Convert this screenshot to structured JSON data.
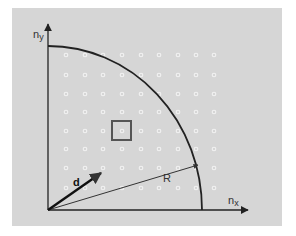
{
  "diagram": {
    "background_color": "#ffffff",
    "panel_color": "#d6d6d6",
    "line_color": "#222222",
    "dot_color": "#f2f2f2",
    "axes": {
      "x_label": "n",
      "x_label_sub": "x",
      "y_label": "n",
      "y_label_sub": "y"
    },
    "vectors": {
      "d_label": "d",
      "R_label": "R"
    },
    "grid": {
      "columns": [
        66,
        85,
        103,
        122,
        141,
        159,
        178,
        196,
        214
      ],
      "rows": [
        55,
        75,
        94,
        112,
        131,
        149,
        168,
        188
      ]
    },
    "highlight_cell": {
      "x": 112,
      "y": 121,
      "size": 20
    }
  }
}
